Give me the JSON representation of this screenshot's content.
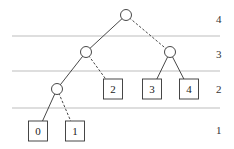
{
  "diagram": {
    "type": "tree",
    "level_labels": [
      {
        "label": "4",
        "y": 20
      },
      {
        "label": "3",
        "y": 55
      },
      {
        "label": "2",
        "y": 90
      },
      {
        "label": "1",
        "y": 131
      }
    ],
    "separators_y": [
      36,
      71,
      108
    ],
    "internal_nodes": [
      {
        "id": "root",
        "x": 126,
        "y": 15
      },
      {
        "id": "n3a",
        "x": 86,
        "y": 52
      },
      {
        "id": "n3b",
        "x": 170,
        "y": 52
      },
      {
        "id": "n2a",
        "x": 57,
        "y": 89
      }
    ],
    "leaves": [
      {
        "label": "0",
        "x": 38,
        "y": 131
      },
      {
        "label": "1",
        "x": 75,
        "y": 131
      },
      {
        "label": "2",
        "x": 113,
        "y": 89
      },
      {
        "label": "3",
        "x": 152,
        "y": 89
      },
      {
        "label": "4",
        "x": 189,
        "y": 89
      }
    ],
    "edges": [
      {
        "from": [
          126,
          15
        ],
        "to": [
          86,
          52
        ],
        "style": "solid"
      },
      {
        "from": [
          126,
          15
        ],
        "to": [
          170,
          52
        ],
        "style": "dashed"
      },
      {
        "from": [
          86,
          52
        ],
        "to": [
          57,
          89
        ],
        "style": "solid"
      },
      {
        "from": [
          86,
          52
        ],
        "to": [
          113,
          89
        ],
        "style": "dashed"
      },
      {
        "from": [
          170,
          52
        ],
        "to": [
          152,
          89
        ],
        "style": "solid"
      },
      {
        "from": [
          170,
          52
        ],
        "to": [
          189,
          89
        ],
        "style": "solid"
      },
      {
        "from": [
          57,
          89
        ],
        "to": [
          38,
          131
        ],
        "style": "solid"
      },
      {
        "from": [
          57,
          89
        ],
        "to": [
          75,
          131
        ],
        "style": "dashed"
      }
    ]
  }
}
